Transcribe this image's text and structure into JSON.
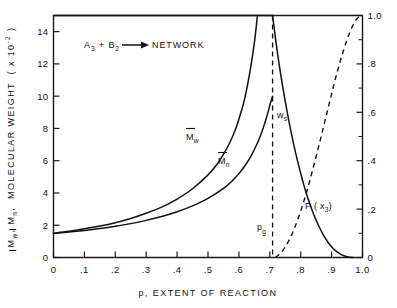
{
  "chart_data": {
    "type": "line",
    "title": "",
    "annotation": "A3 + B2 → NETWORK",
    "annotation_parts": {
      "a": "A",
      "a_sub": "3",
      "plus": "+",
      "b": "B",
      "b_sub": "2",
      "arrow": "→",
      "product": "NETWORK"
    },
    "xlabel": "p , EXTENT OF REACTION",
    "xlabel_parts": {
      "symbol": "p",
      "comma": ",",
      "text": "EXTENT OF REACTION"
    },
    "ylabel_left": "Mw , Mn , MOLECULAR WEIGHT ( x 10 -2 )",
    "ylabel_left_parts": {
      "m1": "M",
      "m1_sub": "w",
      "c1": ",",
      "m2": "M",
      "m2_sub": "n",
      "c2": ",",
      "text": "MOLECULAR WEIGHT",
      "paren_open": "( x 10",
      "exp": "-2",
      "paren_close": ")"
    },
    "ylabel_right": "",
    "xlim": [
      0,
      1.0
    ],
    "ylim_left": [
      0,
      15
    ],
    "ylim_right": [
      0,
      1.0
    ],
    "xticks": [
      0,
      0.1,
      0.2,
      0.3,
      0.4,
      0.5,
      0.6,
      0.7,
      0.8,
      0.9,
      1.0
    ],
    "xticklabels": [
      "0",
      ".1",
      ".2",
      ".3",
      ".4",
      ".5",
      ".6",
      ".7",
      ".8",
      ".9",
      "1.0"
    ],
    "yticks_left": [
      0,
      2,
      4,
      6,
      8,
      10,
      12,
      14
    ],
    "yticklabels_left": [
      "0",
      "2",
      "4",
      "6",
      "8",
      "10",
      "12",
      "14"
    ],
    "yticks_right": [
      0,
      0.2,
      0.4,
      0.6,
      0.8,
      1.0
    ],
    "yticklabels_right": [
      "0",
      ".2",
      ".4",
      ".6",
      ".8",
      "1.0"
    ],
    "yticks_right_minor": [
      0.1,
      0.3,
      0.5,
      0.7,
      0.9
    ],
    "grid": false,
    "legend": "none",
    "gel_point": 0.709,
    "gel_point_label": "p",
    "gel_point_sublabel": "g",
    "series": [
      {
        "name": "Mw",
        "label_main": "M",
        "label_sub": "w",
        "style": "solid",
        "axis": "left",
        "points": [
          [
            0.0,
            1.5
          ],
          [
            0.05,
            1.62
          ],
          [
            0.1,
            1.78
          ],
          [
            0.15,
            1.95
          ],
          [
            0.2,
            2.16
          ],
          [
            0.25,
            2.42
          ],
          [
            0.3,
            2.74
          ],
          [
            0.35,
            3.12
          ],
          [
            0.4,
            3.62
          ],
          [
            0.45,
            4.26
          ],
          [
            0.5,
            5.12
          ],
          [
            0.53,
            5.8
          ],
          [
            0.55,
            6.4
          ],
          [
            0.57,
            7.1
          ],
          [
            0.59,
            8.0
          ],
          [
            0.61,
            9.2
          ],
          [
            0.62,
            9.95
          ],
          [
            0.63,
            10.9
          ],
          [
            0.64,
            12.0
          ],
          [
            0.65,
            13.3
          ],
          [
            0.655,
            14.1
          ],
          [
            0.66,
            15.0
          ]
        ]
      },
      {
        "name": "Mn",
        "label_main": "M",
        "label_sub": "n",
        "style": "solid",
        "axis": "left",
        "points": [
          [
            0.0,
            1.5
          ],
          [
            0.05,
            1.58
          ],
          [
            0.1,
            1.68
          ],
          [
            0.15,
            1.8
          ],
          [
            0.2,
            1.94
          ],
          [
            0.25,
            2.1
          ],
          [
            0.3,
            2.3
          ],
          [
            0.35,
            2.54
          ],
          [
            0.4,
            2.84
          ],
          [
            0.45,
            3.2
          ],
          [
            0.5,
            3.66
          ],
          [
            0.55,
            4.28
          ],
          [
            0.58,
            4.78
          ],
          [
            0.6,
            5.2
          ],
          [
            0.62,
            5.7
          ],
          [
            0.64,
            6.32
          ],
          [
            0.66,
            7.1
          ],
          [
            0.67,
            7.56
          ],
          [
            0.68,
            8.1
          ],
          [
            0.69,
            8.72
          ],
          [
            0.7,
            9.42
          ],
          [
            0.705,
            9.75
          ],
          [
            0.709,
            10.0
          ]
        ]
      },
      {
        "name": "ws",
        "label_main": "w",
        "label_sub": "s",
        "style": "solid",
        "axis": "right",
        "note": "sol fraction, plotted on right axis; equals 1.0 for p < pg",
        "points_pre_gel": [
          [
            0.0,
            1.0
          ],
          [
            0.709,
            1.0
          ]
        ],
        "points": [
          [
            0.709,
            1.0
          ],
          [
            0.715,
            0.94
          ],
          [
            0.72,
            0.89
          ],
          [
            0.73,
            0.8
          ],
          [
            0.74,
            0.72
          ],
          [
            0.75,
            0.645
          ],
          [
            0.76,
            0.575
          ],
          [
            0.77,
            0.512
          ],
          [
            0.78,
            0.452
          ],
          [
            0.79,
            0.398
          ],
          [
            0.8,
            0.348
          ],
          [
            0.81,
            0.3
          ],
          [
            0.82,
            0.258
          ],
          [
            0.83,
            0.22
          ],
          [
            0.84,
            0.185
          ],
          [
            0.85,
            0.154
          ],
          [
            0.86,
            0.126
          ],
          [
            0.87,
            0.101
          ],
          [
            0.88,
            0.079
          ],
          [
            0.89,
            0.06
          ],
          [
            0.9,
            0.044
          ],
          [
            0.91,
            0.031
          ],
          [
            0.92,
            0.021
          ],
          [
            0.93,
            0.013
          ],
          [
            0.94,
            0.007
          ],
          [
            0.95,
            0.003
          ],
          [
            0.96,
            0.001
          ],
          [
            0.97,
            0.0
          ]
        ]
      },
      {
        "name": "P(x3)",
        "label_main": "P ( x",
        "label_sub": "3",
        "label_close": ")",
        "style": "dashed",
        "axis": "right",
        "points": [
          [
            0.718,
            0.0
          ],
          [
            0.73,
            0.012
          ],
          [
            0.74,
            0.026
          ],
          [
            0.75,
            0.044
          ],
          [
            0.76,
            0.066
          ],
          [
            0.77,
            0.092
          ],
          [
            0.78,
            0.122
          ],
          [
            0.79,
            0.155
          ],
          [
            0.8,
            0.192
          ],
          [
            0.81,
            0.232
          ],
          [
            0.82,
            0.275
          ],
          [
            0.83,
            0.32
          ],
          [
            0.84,
            0.368
          ],
          [
            0.85,
            0.418
          ],
          [
            0.86,
            0.468
          ],
          [
            0.87,
            0.52
          ],
          [
            0.88,
            0.572
          ],
          [
            0.89,
            0.624
          ],
          [
            0.9,
            0.676
          ],
          [
            0.91,
            0.727
          ],
          [
            0.92,
            0.775
          ],
          [
            0.93,
            0.82
          ],
          [
            0.94,
            0.862
          ],
          [
            0.95,
            0.9
          ],
          [
            0.96,
            0.934
          ],
          [
            0.97,
            0.962
          ],
          [
            0.98,
            0.983
          ],
          [
            0.99,
            0.996
          ],
          [
            1.0,
            1.0
          ]
        ]
      }
    ],
    "annotations": [
      {
        "name": "ws-label",
        "text": "ws",
        "x": 0.735,
        "y_right": 0.93
      },
      {
        "name": "pg-label",
        "text": "pg",
        "x": 0.695,
        "y_right": 0.135
      },
      {
        "name": "Mw-label",
        "text": "Mw",
        "x": 0.455,
        "y_left": 7.4
      },
      {
        "name": "Mn-label",
        "text": "Mn",
        "x": 0.545,
        "y_left": 5.5
      },
      {
        "name": "Px3-label",
        "text": "P(x3)",
        "x": 0.885,
        "y_right": 0.3
      }
    ]
  },
  "labels": {
    "ws": {
      "main": "w",
      "sub": "s"
    },
    "pg": {
      "main": "p",
      "sub": "g"
    }
  },
  "colors": {
    "ink": "#111111",
    "background": "#ffffff"
  }
}
